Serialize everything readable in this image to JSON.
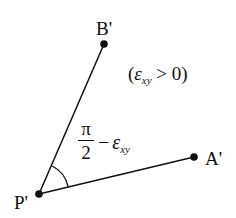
{
  "diagram": {
    "type": "shear-strain-deformed-angle",
    "points": {
      "P": {
        "label": "P'",
        "x": 39,
        "y": 194
      },
      "A": {
        "label": "A'",
        "x": 194,
        "y": 157
      },
      "B": {
        "label": "B'",
        "x": 104,
        "y": 44
      }
    },
    "condition": {
      "open": "(",
      "symbol": "ε",
      "subscript": "xy",
      "relation": " > 0)"
    },
    "angle_label": {
      "numerator": "π",
      "denominator": "2",
      "minus": "−",
      "symbol": "ε",
      "subscript": "xy"
    },
    "colors": {
      "stroke": "#111111",
      "background": "#ffffff"
    }
  }
}
